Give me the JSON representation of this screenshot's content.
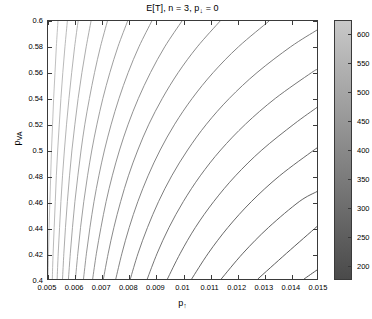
{
  "chart_data": {
    "type": "line",
    "title": "E[T], n = 3, p↓ = 0",
    "title_main": "E[T], n = 3, p",
    "title_sub": "↓",
    "title_tail": " = 0",
    "xlabel_main": "p",
    "xlabel_sub": "↑",
    "ylabel_main": "p",
    "ylabel_sub": "VA",
    "xlim": [
      0.005,
      0.015
    ],
    "ylim": [
      0.4,
      0.6
    ],
    "grid": false,
    "legend": "none",
    "xticks": [
      0.005,
      0.006,
      0.007,
      0.008,
      0.009,
      0.01,
      0.011,
      0.012,
      0.013,
      0.014,
      0.015
    ],
    "xtick_labels": [
      "0.005",
      "0.006",
      "0.007",
      "0.008",
      "0.009",
      "0.01",
      "0.011",
      "0.012",
      "0.013",
      "0.014",
      "0.015"
    ],
    "yticks": [
      0.4,
      0.42,
      0.44,
      0.46,
      0.48,
      0.5,
      0.52,
      0.54,
      0.56,
      0.58,
      0.6
    ],
    "ytick_labels": [
      "0.4",
      "0.42",
      "0.44",
      "0.46",
      "0.48",
      "0.5",
      "0.52",
      "0.54",
      "0.56",
      "0.58",
      "0.6"
    ],
    "colorbar": {
      "ticks": [
        200,
        250,
        300,
        350,
        400,
        450,
        500,
        550,
        600
      ],
      "tick_labels": [
        "200",
        "250",
        "300",
        "350",
        "400",
        "450",
        "500",
        "550",
        "600"
      ],
      "min": 175,
      "max": 625,
      "colormap": "gray",
      "top_color": "#c8c8c8",
      "bottom_color": "#4a4a4a"
    },
    "contour_levels": [
      200,
      225,
      250,
      275,
      300,
      325,
      350,
      375,
      400,
      425,
      450,
      475,
      500,
      525,
      550,
      575,
      600,
      625
    ],
    "contours": [
      {
        "level": 625,
        "color": "#b9b9b9",
        "points": [
          [
            0.005,
            0.4
          ],
          [
            0.00502,
            0.42
          ],
          [
            0.00504,
            0.44
          ],
          [
            0.00507,
            0.46
          ],
          [
            0.0051,
            0.48
          ],
          [
            0.00513,
            0.5
          ],
          [
            0.00517,
            0.52
          ],
          [
            0.00521,
            0.54
          ],
          [
            0.00526,
            0.56
          ],
          [
            0.00531,
            0.58
          ],
          [
            0.00537,
            0.6
          ]
        ]
      },
      {
        "level": 600,
        "color": "#b2b2b2",
        "points": [
          [
            0.00516,
            0.4
          ],
          [
            0.00519,
            0.42
          ],
          [
            0.00523,
            0.44
          ],
          [
            0.00527,
            0.46
          ],
          [
            0.00531,
            0.48
          ],
          [
            0.00536,
            0.5
          ],
          [
            0.00542,
            0.52
          ],
          [
            0.00548,
            0.54
          ],
          [
            0.00555,
            0.56
          ],
          [
            0.00563,
            0.58
          ],
          [
            0.00572,
            0.6
          ]
        ]
      },
      {
        "level": 575,
        "color": "#ababab",
        "points": [
          [
            0.00534,
            0.4
          ],
          [
            0.00538,
            0.42
          ],
          [
            0.00543,
            0.44
          ],
          [
            0.00548,
            0.46
          ],
          [
            0.00554,
            0.48
          ],
          [
            0.00561,
            0.5
          ],
          [
            0.00569,
            0.52
          ],
          [
            0.00578,
            0.54
          ],
          [
            0.00588,
            0.56
          ],
          [
            0.00599,
            0.58
          ],
          [
            0.00612,
            0.6
          ]
        ]
      },
      {
        "level": 550,
        "color": "#a3a3a3",
        "points": [
          [
            0.00554,
            0.4
          ],
          [
            0.00559,
            0.42
          ],
          [
            0.00565,
            0.44
          ],
          [
            0.00572,
            0.46
          ],
          [
            0.0058,
            0.48
          ],
          [
            0.00589,
            0.5
          ],
          [
            0.006,
            0.52
          ],
          [
            0.00612,
            0.54
          ],
          [
            0.00626,
            0.56
          ],
          [
            0.00642,
            0.58
          ],
          [
            0.0066,
            0.6
          ]
        ]
      },
      {
        "level": 525,
        "color": "#9b9b9b",
        "points": [
          [
            0.00576,
            0.4
          ],
          [
            0.00583,
            0.42
          ],
          [
            0.00591,
            0.44
          ],
          [
            0.006,
            0.46
          ],
          [
            0.00611,
            0.48
          ],
          [
            0.00623,
            0.5
          ],
          [
            0.00637,
            0.52
          ],
          [
            0.00654,
            0.54
          ],
          [
            0.00673,
            0.56
          ],
          [
            0.00695,
            0.58
          ],
          [
            0.00721,
            0.6
          ]
        ]
      },
      {
        "level": 500,
        "color": "#949494",
        "points": [
          [
            0.00602,
            0.4
          ],
          [
            0.00611,
            0.42
          ],
          [
            0.00621,
            0.44
          ],
          [
            0.00633,
            0.46
          ],
          [
            0.00647,
            0.48
          ],
          [
            0.00663,
            0.5
          ],
          [
            0.00682,
            0.52
          ],
          [
            0.00704,
            0.54
          ],
          [
            0.0073,
            0.56
          ],
          [
            0.0076,
            0.58
          ],
          [
            0.00796,
            0.6
          ]
        ]
      },
      {
        "level": 475,
        "color": "#8c8c8c",
        "points": [
          [
            0.00632,
            0.4
          ],
          [
            0.00643,
            0.42
          ],
          [
            0.00656,
            0.44
          ],
          [
            0.00671,
            0.46
          ],
          [
            0.00689,
            0.48
          ],
          [
            0.0071,
            0.5
          ],
          [
            0.00735,
            0.52
          ],
          [
            0.00764,
            0.54
          ],
          [
            0.00798,
            0.56
          ],
          [
            0.00838,
            0.58
          ],
          [
            0.00886,
            0.6
          ]
        ]
      },
      {
        "level": 450,
        "color": "#858585",
        "points": [
          [
            0.00666,
            0.4
          ],
          [
            0.0068,
            0.42
          ],
          [
            0.00697,
            0.44
          ],
          [
            0.00716,
            0.46
          ],
          [
            0.00739,
            0.48
          ],
          [
            0.00766,
            0.5
          ],
          [
            0.00798,
            0.52
          ],
          [
            0.00836,
            0.54
          ],
          [
            0.00881,
            0.56
          ],
          [
            0.00934,
            0.58
          ],
          [
            0.00998,
            0.6
          ]
        ]
      },
      {
        "level": 425,
        "color": "#7d7d7d",
        "points": [
          [
            0.00706,
            0.4
          ],
          [
            0.00724,
            0.42
          ],
          [
            0.00745,
            0.44
          ],
          [
            0.0077,
            0.46
          ],
          [
            0.00799,
            0.48
          ],
          [
            0.00834,
            0.5
          ],
          [
            0.00875,
            0.52
          ],
          [
            0.00925,
            0.54
          ],
          [
            0.00984,
            0.56
          ],
          [
            0.01055,
            0.58
          ],
          [
            0.0114,
            0.6
          ]
        ]
      },
      {
        "level": 400,
        "color": "#767676",
        "points": [
          [
            0.00752,
            0.4
          ],
          [
            0.00775,
            0.42
          ],
          [
            0.00802,
            0.44
          ],
          [
            0.00834,
            0.46
          ],
          [
            0.00872,
            0.48
          ],
          [
            0.00917,
            0.5
          ],
          [
            0.00971,
            0.52
          ],
          [
            0.01036,
            0.54
          ],
          [
            0.01114,
            0.56
          ],
          [
            0.01208,
            0.58
          ],
          [
            0.01322,
            0.6
          ]
        ]
      },
      {
        "level": 375,
        "color": "#6e6e6e",
        "points": [
          [
            0.00806,
            0.4
          ],
          [
            0.00835,
            0.42
          ],
          [
            0.0087,
            0.44
          ],
          [
            0.00911,
            0.46
          ],
          [
            0.0096,
            0.48
          ],
          [
            0.01019,
            0.5
          ],
          [
            0.01089,
            0.52
          ],
          [
            0.01174,
            0.54
          ],
          [
            0.01277,
            0.56
          ],
          [
            0.01402,
            0.58
          ],
          [
            0.015,
            0.593
          ]
        ]
      },
      {
        "level": 350,
        "color": "#676767",
        "points": [
          [
            0.00869,
            0.4
          ],
          [
            0.00906,
            0.42
          ],
          [
            0.0095,
            0.44
          ],
          [
            0.01003,
            0.46
          ],
          [
            0.01066,
            0.48
          ],
          [
            0.01142,
            0.5
          ],
          [
            0.01234,
            0.52
          ],
          [
            0.01345,
            0.54
          ],
          [
            0.0148,
            0.56
          ],
          [
            0.015,
            0.5622
          ]
        ]
      },
      {
        "level": 325,
        "color": "#5f5f5f",
        "points": [
          [
            0.00944,
            0.4
          ],
          [
            0.00992,
            0.42
          ],
          [
            0.01048,
            0.44
          ],
          [
            0.01116,
            0.46
          ],
          [
            0.01197,
            0.48
          ],
          [
            0.01295,
            0.5
          ],
          [
            0.01414,
            0.52
          ],
          [
            0.015,
            0.533
          ]
        ]
      },
      {
        "level": 300,
        "color": "#575757",
        "points": [
          [
            0.01034,
            0.4
          ],
          [
            0.01096,
            0.42
          ],
          [
            0.01169,
            0.44
          ],
          [
            0.01256,
            0.46
          ],
          [
            0.01361,
            0.48
          ],
          [
            0.01489,
            0.5
          ],
          [
            0.015,
            0.5013
          ]
        ]
      },
      {
        "level": 275,
        "color": "#505050",
        "points": [
          [
            0.01144,
            0.4
          ],
          [
            0.01225,
            0.42
          ],
          [
            0.0132,
            0.44
          ],
          [
            0.01434,
            0.46
          ],
          [
            0.015,
            0.4678
          ]
        ]
      },
      {
        "level": 250,
        "color": "#484848",
        "points": [
          [
            0.0128,
            0.4
          ],
          [
            0.01387,
            0.42
          ],
          [
            0.015,
            0.4407
          ]
        ]
      },
      {
        "level": 225,
        "color": "#414141",
        "points": [
          [
            0.01452,
            0.4
          ],
          [
            0.015,
            0.407
          ]
        ]
      }
    ]
  },
  "axes": {
    "plot_border_color": "#3a3a3a"
  }
}
